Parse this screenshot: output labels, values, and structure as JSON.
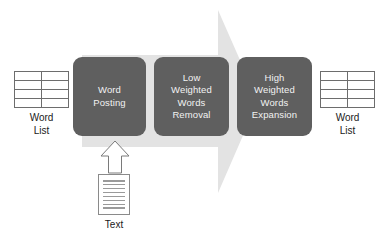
{
  "diagram": {
    "background_arrow": {
      "name": "process-flow-arrow",
      "direction": "right",
      "color": "#e2e2e2"
    },
    "steps": [
      {
        "id": "step-1",
        "label": "Word\nPosting",
        "fill": "#5f5f5f",
        "text_color": "#f2f2f2"
      },
      {
        "id": "step-2",
        "label": "Low\nWeighted\nWords\nRemoval",
        "fill": "#5f5f5f",
        "text_color": "#f2f2f2"
      },
      {
        "id": "step-3",
        "label": "High\nWeighted\nWords\nExpansion",
        "fill": "#5f5f5f",
        "text_color": "#f2f2f2"
      }
    ],
    "input_list": {
      "caption": "Word\nList",
      "rows": 4,
      "columns": 2
    },
    "output_list": {
      "caption": "Word\nList",
      "rows": 4,
      "columns": 2
    },
    "input_document": {
      "caption": "Text",
      "line_count": 8
    },
    "input_arrow": {
      "name": "text-input-arrow",
      "direction": "up",
      "stroke": "#6d6d6d",
      "fill": "#ffffff"
    }
  }
}
